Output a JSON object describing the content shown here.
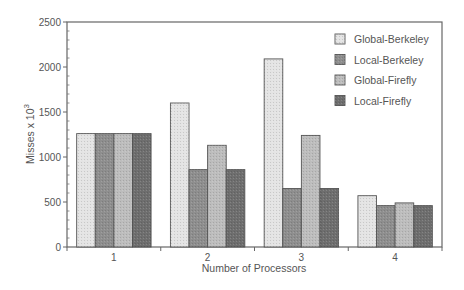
{
  "chart_data": {
    "type": "bar",
    "title": "",
    "xlabel": "Number of Processors",
    "ylabel": "Misses x 10^3",
    "ylabel_base": "Misses x 10",
    "ylabel_exp": "3",
    "categories": [
      "1",
      "2",
      "3",
      "4"
    ],
    "ylim": [
      0,
      2500
    ],
    "yticks": [
      0,
      500,
      1000,
      1500,
      2000,
      2500
    ],
    "grid": false,
    "legend_position": "upper right",
    "series": [
      {
        "name": "Global-Berkeley",
        "values": [
          1260,
          1600,
          2090,
          570
        ],
        "color": "#e4e4e4"
      },
      {
        "name": "Local-Berkeley",
        "values": [
          1260,
          860,
          650,
          460
        ],
        "color": "#8e8e8e"
      },
      {
        "name": "Global-Firefly",
        "values": [
          1260,
          1130,
          1240,
          490
        ],
        "color": "#bdbdbd"
      },
      {
        "name": "Local-Firefly",
        "values": [
          1260,
          860,
          650,
          460
        ],
        "color": "#6e6e6e"
      }
    ]
  }
}
